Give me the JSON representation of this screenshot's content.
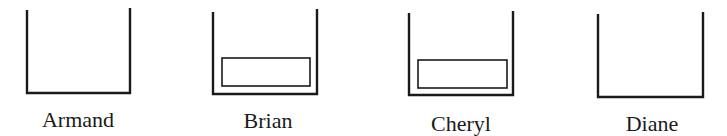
{
  "diagram": {
    "containers": [
      {
        "name": "Armand",
        "has_block": false,
        "left": 27,
        "right": 130,
        "top_left": 10,
        "top_right": 8,
        "bottom": 93,
        "label_x": 78,
        "label_y": 127
      },
      {
        "name": "Brian",
        "has_block": true,
        "left": 213,
        "right": 317,
        "top_left": 12,
        "top_right": 9,
        "bottom": 94,
        "block": {
          "x": 222,
          "y": 58,
          "w": 88,
          "h": 28
        },
        "label_x": 268,
        "label_y": 128
      },
      {
        "name": "Cheryl",
        "has_block": true,
        "left": 409,
        "right": 513,
        "top_left": 13,
        "top_right": 11,
        "bottom": 95,
        "block": {
          "x": 418,
          "y": 60,
          "w": 89,
          "h": 28
        },
        "label_x": 461,
        "label_y": 131
      },
      {
        "name": "Diane",
        "has_block": false,
        "left": 598,
        "right": 703,
        "top_left": 14,
        "top_right": 12,
        "bottom": 97,
        "label_x": 652,
        "label_y": 131
      }
    ]
  }
}
